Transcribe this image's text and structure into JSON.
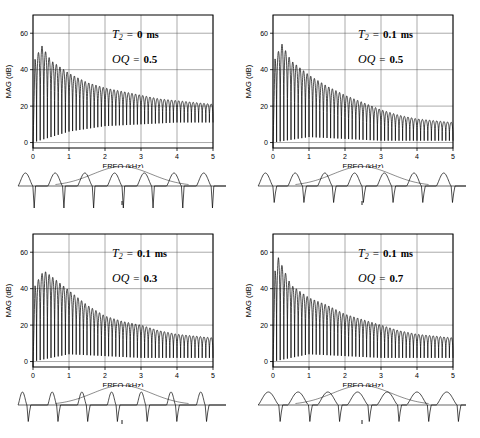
{
  "figure": {
    "panel_count": 4,
    "axis": {
      "xlabel": "FREQ (kHz)",
      "ylabel": "MAG (dB)",
      "xticks": [
        "0",
        "1",
        "2",
        "3",
        "4",
        "5"
      ],
      "yticks": [
        "0",
        "20",
        "40",
        "60"
      ],
      "xlim": [
        0,
        5
      ],
      "ylim": [
        -3,
        70
      ],
      "grid": true
    },
    "symbols": {
      "t2_name": "T",
      "t2_sub": "2",
      "oq_name": "OQ",
      "equals": "=",
      "unit_ms": "ms"
    },
    "panels": [
      {
        "id": "panel-top-left",
        "t2_value": "0",
        "oq_value": "0.5",
        "t2_label": "T2  =  0 ms",
        "oq_label": "OQ  =  0.5"
      },
      {
        "id": "panel-top-right",
        "t2_value": "0.1",
        "oq_value": "0.5",
        "t2_label": "T2  =  0.1 ms",
        "oq_label": "OQ  =  0.5"
      },
      {
        "id": "panel-bottom-left",
        "t2_value": "0.1",
        "oq_value": "0.3",
        "t2_label": "T2  =  0.1 ms",
        "oq_label": "OQ  =  0.3"
      },
      {
        "id": "panel-bottom-right",
        "t2_value": "0.1",
        "oq_value": "0.7",
        "t2_label": "T2  =  0.1 ms",
        "oq_label": "OQ  =  0.7"
      }
    ]
  },
  "chart_data": [
    {
      "type": "line",
      "title": "T2 = 0 ms, OQ = 0.5",
      "xlabel": "FREQ (kHz)",
      "ylabel": "MAG (dB)",
      "xlim": [
        0,
        5
      ],
      "ylim": [
        -3,
        70
      ],
      "xticks": [
        0,
        1,
        2,
        3,
        4,
        5
      ],
      "yticks": [
        0,
        20,
        40,
        60
      ],
      "grid": true,
      "description": "Harmonic comb spectrum of glottal flow derivative; spectral peak envelope decays from about 53 dB near 0.25 kHz to about 21 dB at 5 kHz; nulls reach down to roughly 0-12 dB.",
      "params": {
        "T2_ms": 0,
        "OQ": 0.5,
        "F0_Hz": 100
      },
      "envelope_points": [
        {
          "f": 0.0,
          "peak_db": 44
        },
        {
          "f": 0.25,
          "peak_db": 53
        },
        {
          "f": 0.5,
          "peak_db": 45
        },
        {
          "f": 1.0,
          "peak_db": 38
        },
        {
          "f": 1.5,
          "peak_db": 33
        },
        {
          "f": 2.0,
          "peak_db": 30
        },
        {
          "f": 2.5,
          "peak_db": 28
        },
        {
          "f": 3.0,
          "peak_db": 26
        },
        {
          "f": 3.5,
          "peak_db": 24
        },
        {
          "f": 4.0,
          "peak_db": 23
        },
        {
          "f": 4.5,
          "peak_db": 22
        },
        {
          "f": 5.0,
          "peak_db": 21
        }
      ],
      "null_floor_db": [
        {
          "f": 0.0,
          "db": 0
        },
        {
          "f": 1.0,
          "db": 6
        },
        {
          "f": 2.0,
          "db": 9
        },
        {
          "f": 3.0,
          "db": 10
        },
        {
          "f": 4.0,
          "db": 11
        },
        {
          "f": 5.0,
          "db": 11
        }
      ],
      "waveform": {
        "type": "glottal-flow-derivative",
        "periods": 7,
        "open_quotient": 0.5,
        "spectral_tilt_ms": 0,
        "has_envelope_arc": true,
        "has_center_marker": true
      }
    },
    {
      "type": "line",
      "title": "T2 = 0.1 ms, OQ = 0.5",
      "xlabel": "FREQ (kHz)",
      "ylabel": "MAG (dB)",
      "xlim": [
        0,
        5
      ],
      "ylim": [
        -3,
        70
      ],
      "xticks": [
        0,
        1,
        2,
        3,
        4,
        5
      ],
      "yticks": [
        0,
        20,
        40,
        60
      ],
      "grid": true,
      "description": "Same source with 0.1 ms spectral tilt; peaks fall from about 54 dB near 0.25 kHz to about 11 dB at 5 kHz, a steeper high-frequency rolloff than the T2 = 0 ms case.",
      "params": {
        "T2_ms": 0.1,
        "OQ": 0.5,
        "F0_Hz": 100
      },
      "envelope_points": [
        {
          "f": 0.0,
          "peak_db": 44
        },
        {
          "f": 0.25,
          "peak_db": 54
        },
        {
          "f": 0.5,
          "peak_db": 45
        },
        {
          "f": 1.0,
          "peak_db": 37
        },
        {
          "f": 1.5,
          "peak_db": 31
        },
        {
          "f": 2.0,
          "peak_db": 26
        },
        {
          "f": 2.5,
          "peak_db": 22
        },
        {
          "f": 3.0,
          "peak_db": 18
        },
        {
          "f": 3.5,
          "peak_db": 15
        },
        {
          "f": 4.0,
          "peak_db": 13
        },
        {
          "f": 4.5,
          "peak_db": 12
        },
        {
          "f": 5.0,
          "peak_db": 11
        }
      ],
      "null_floor_db": [
        {
          "f": 0.0,
          "db": 0
        },
        {
          "f": 1.0,
          "db": 3
        },
        {
          "f": 2.0,
          "db": 2
        },
        {
          "f": 3.0,
          "db": 1
        },
        {
          "f": 4.0,
          "db": 1
        },
        {
          "f": 5.0,
          "db": 1
        }
      ],
      "waveform": {
        "type": "glottal-flow-derivative",
        "periods": 7,
        "open_quotient": 0.5,
        "spectral_tilt_ms": 0.1,
        "has_envelope_arc": true,
        "has_center_marker": true
      }
    },
    {
      "type": "line",
      "title": "T2 = 0.1 ms, OQ = 0.3",
      "xlabel": "FREQ (kHz)",
      "ylabel": "MAG (dB)",
      "xlim": [
        0,
        5
      ],
      "ylim": [
        -3,
        70
      ],
      "xticks": [
        0,
        1,
        2,
        3,
        4,
        5
      ],
      "yticks": [
        0,
        20,
        40,
        60
      ],
      "grid": true,
      "description": "Short open quotient 0.3 gives narrow pulses; peak envelope falls from about 50 dB near 0.3 kHz to about 13 dB at 5 kHz with broad spectral lobes.",
      "params": {
        "T2_ms": 0.1,
        "OQ": 0.3,
        "F0_Hz": 100
      },
      "envelope_points": [
        {
          "f": 0.0,
          "peak_db": 40
        },
        {
          "f": 0.3,
          "peak_db": 50
        },
        {
          "f": 0.5,
          "peak_db": 47
        },
        {
          "f": 1.0,
          "peak_db": 39
        },
        {
          "f": 1.5,
          "peak_db": 31
        },
        {
          "f": 2.0,
          "peak_db": 25
        },
        {
          "f": 2.5,
          "peak_db": 22
        },
        {
          "f": 3.0,
          "peak_db": 20
        },
        {
          "f": 3.5,
          "peak_db": 17
        },
        {
          "f": 4.0,
          "peak_db": 15
        },
        {
          "f": 4.5,
          "peak_db": 14
        },
        {
          "f": 5.0,
          "peak_db": 13
        }
      ],
      "null_floor_db": [
        {
          "f": 0.0,
          "db": 0
        },
        {
          "f": 1.0,
          "db": 4
        },
        {
          "f": 2.0,
          "db": 3
        },
        {
          "f": 3.0,
          "db": 2
        },
        {
          "f": 4.0,
          "db": 2
        },
        {
          "f": 5.0,
          "db": 2
        }
      ],
      "waveform": {
        "type": "glottal-flow-derivative",
        "periods": 7,
        "open_quotient": 0.3,
        "spectral_tilt_ms": 0.1,
        "has_envelope_arc": true,
        "has_center_marker": true
      }
    },
    {
      "type": "line",
      "title": "T2 = 0.1 ms, OQ = 0.7",
      "xlabel": "FREQ (kHz)",
      "ylabel": "MAG (dB)",
      "xlim": [
        0,
        5
      ],
      "ylim": [
        -3,
        70
      ],
      "xticks": [
        0,
        1,
        2,
        3,
        4,
        5
      ],
      "yticks": [
        0,
        20,
        40,
        60
      ],
      "grid": true,
      "description": "Long open quotient 0.7 gives wide pulses; peak envelope falls from about 57 dB near 0.15 kHz to about 13 dB at 5 kHz with a deep notch near 0.9 kHz.",
      "params": {
        "T2_ms": 0.1,
        "OQ": 0.7,
        "F0_Hz": 100
      },
      "envelope_points": [
        {
          "f": 0.0,
          "peak_db": 46
        },
        {
          "f": 0.15,
          "peak_db": 57
        },
        {
          "f": 0.5,
          "peak_db": 42
        },
        {
          "f": 1.0,
          "peak_db": 35
        },
        {
          "f": 1.5,
          "peak_db": 31
        },
        {
          "f": 2.0,
          "peak_db": 26
        },
        {
          "f": 2.5,
          "peak_db": 23
        },
        {
          "f": 3.0,
          "peak_db": 20
        },
        {
          "f": 3.5,
          "peak_db": 17
        },
        {
          "f": 4.0,
          "peak_db": 15
        },
        {
          "f": 4.5,
          "peak_db": 14
        },
        {
          "f": 5.0,
          "peak_db": 13
        }
      ],
      "null_floor_db": [
        {
          "f": 0.0,
          "db": 0
        },
        {
          "f": 1.0,
          "db": 4
        },
        {
          "f": 2.0,
          "db": 3
        },
        {
          "f": 3.0,
          "db": 2
        },
        {
          "f": 4.0,
          "db": 2
        },
        {
          "f": 5.0,
          "db": 2
        }
      ],
      "waveform": {
        "type": "glottal-flow-derivative",
        "periods": 7,
        "open_quotient": 0.7,
        "spectral_tilt_ms": 0.1,
        "has_envelope_arc": true,
        "has_center_marker": true
      }
    }
  ]
}
